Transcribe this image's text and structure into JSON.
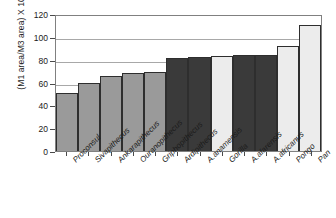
{
  "chart_data": {
    "type": "bar",
    "title": "",
    "xlabel": "",
    "ylabel": "(M1 area/M3 area) X 100",
    "ylim": [
      0,
      120
    ],
    "ytick_labels": [
      "120",
      "100",
      "80",
      "60",
      "40",
      "20",
      "0"
    ],
    "yticks": [
      120,
      100,
      80,
      60,
      40,
      20,
      0
    ],
    "grid": true,
    "legend": "none",
    "categories": [
      "Proconsul",
      "Sivapithecus",
      "Ankarapithecus",
      "Ouranopithecus",
      "Griphopithecus",
      "Ardipithecus",
      "A.anamensis",
      "Gorilla",
      "A.afarensis",
      "A.africanus",
      "Pongo",
      "Pan"
    ],
    "values": [
      51,
      60,
      66,
      68,
      69,
      81.5,
      82,
      83,
      84,
      84,
      92,
      110
    ],
    "bar_shades": [
      "mid",
      "mid",
      "mid",
      "mid",
      "mid",
      "dark",
      "dark",
      "light",
      "dark",
      "dark",
      "light",
      "light"
    ],
    "colors": {
      "mid": "#9a9a9a",
      "dark": "#3a3a3a",
      "light": "#ececec",
      "bar_outline": "#2e2e2e",
      "gridline": "#a8a8a8",
      "axis": "#808080",
      "text": "#1a1a1a",
      "background": "#ffffff"
    }
  }
}
